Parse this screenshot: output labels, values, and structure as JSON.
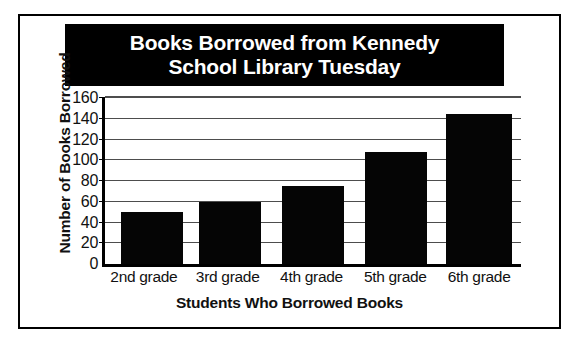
{
  "chart_data": {
    "type": "bar",
    "title": "Books Borrowed from Kennedy School Library Tuesday",
    "title_line1": "Books Borrowed from Kennedy",
    "title_line2": "School Library Tuesday",
    "xlabel": "Students Who Borrowed Books",
    "ylabel": "Number of Books Borrowed",
    "categories": [
      "2nd grade",
      "3rd grade",
      "4th grade",
      "5th grade",
      "6th grade"
    ],
    "values": [
      50,
      60,
      75,
      108,
      145
    ],
    "ylim": [
      0,
      160
    ],
    "ytick_labels": [
      "160",
      "140",
      "120",
      "100",
      "80",
      "60",
      "40",
      "20",
      "0"
    ],
    "ytick_values": [
      160,
      140,
      120,
      100,
      80,
      60,
      40,
      20,
      0
    ],
    "grid": true,
    "legend": "none",
    "bar_color": "#050505",
    "title_background": "#000000",
    "title_color": "#ffffff",
    "grid_color": "#4d4d4d",
    "axis_color": "#000000",
    "frame_color": "#000000",
    "background": "#ffffff"
  }
}
